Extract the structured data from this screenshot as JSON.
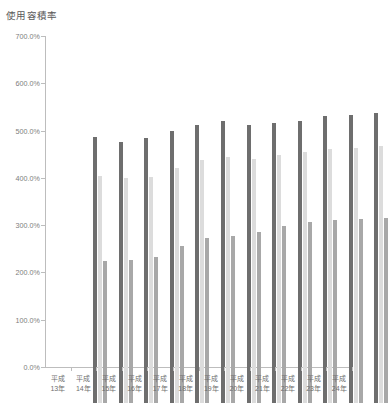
{
  "chart_data": {
    "type": "bar",
    "title": "使用容積率",
    "xlabel": "",
    "ylabel": "",
    "ylim": [
      0,
      700
    ],
    "ytick_labels": [
      "700.0%",
      "600.0%",
      "500.0%",
      "400.0%",
      "300.0%",
      "200.0%",
      "100.0%",
      "0.0%"
    ],
    "ytick_values": [
      700,
      600,
      500,
      400,
      300,
      200,
      100,
      0
    ],
    "grid": false,
    "legend": "none",
    "categories": [
      "平成\n13年",
      "平成\n14年",
      "平成\n15年",
      "平成\n16年",
      "平成\n17年",
      "平成\n18年",
      "平成\n19年",
      "平成\n20年",
      "平成\n21年",
      "平成\n22年",
      "平成\n23年",
      "平成\n24年"
    ],
    "category_lines": [
      [
        "平成",
        "13年"
      ],
      [
        "平成",
        "14年"
      ],
      [
        "平成",
        "15年"
      ],
      [
        "平成",
        "16年"
      ],
      [
        "平成",
        "17年"
      ],
      [
        "平成",
        "18年"
      ],
      [
        "平成",
        "19年"
      ],
      [
        "平成",
        "20年"
      ],
      [
        "平成",
        "21年"
      ],
      [
        "平成",
        "22年"
      ],
      [
        "平成",
        "23年"
      ],
      [
        "平成",
        "24年"
      ]
    ],
    "series": [
      {
        "name": "series-1",
        "color": "#6e6e6e",
        "values": [
          562,
          553,
          560,
          575,
          589,
          596,
          588,
          592,
          597,
          608,
          609,
          613
        ]
      },
      {
        "name": "series-2",
        "color": "#dcdcdc",
        "values": [
          480,
          475,
          478,
          496,
          514,
          521,
          516,
          524,
          530,
          538,
          540,
          543
        ]
      },
      {
        "name": "series-3",
        "color": "#a8a8a8",
        "values": [
          300,
          303,
          309,
          331,
          348,
          353,
          362,
          375,
          382,
          387,
          390,
          391
        ]
      }
    ]
  }
}
